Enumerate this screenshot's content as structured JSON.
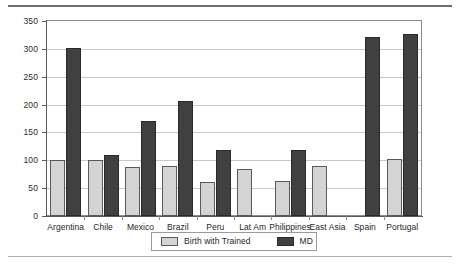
{
  "chart_data": {
    "type": "bar",
    "title": "",
    "subtitle": "",
    "xlabel": "",
    "ylabel": "",
    "ylim": [
      0,
      350
    ],
    "ytick_step": 50,
    "yticks": [
      0,
      50,
      100,
      150,
      200,
      250,
      300,
      350
    ],
    "grid": true,
    "legend_position": "bottom-center",
    "categories": [
      "Argentina",
      "Chile",
      "Mexico",
      "Brazil",
      "Peru",
      "Lat Am",
      "Philippines",
      "East Asia",
      "Spain",
      "Portugal"
    ],
    "series": [
      {
        "name": "Birth with Trained",
        "color": "#d4d4d4",
        "values": [
          100,
          101,
          88,
          90,
          61,
          85,
          62,
          89,
          null,
          103
        ]
      },
      {
        "name": "MD",
        "color": "#404040",
        "values": [
          301,
          110,
          171,
          207,
          118,
          null,
          118,
          null,
          322,
          326
        ]
      }
    ]
  },
  "legend": {
    "items": [
      {
        "label": "Birth with Trained",
        "swatch": "light-gray-swatch"
      },
      {
        "label": "MD",
        "swatch": "dark-gray-swatch"
      }
    ]
  },
  "colors": {
    "series_light": "#d4d4d4",
    "series_dark": "#404040",
    "gridline": "#c8c8c8",
    "axis": "#595959",
    "frame": "#8a8a8a",
    "rule_top": "#6d6d6d",
    "rule_bottom": "#b0b0b0",
    "text": "#1f1f1f",
    "background": "#ffffff"
  }
}
